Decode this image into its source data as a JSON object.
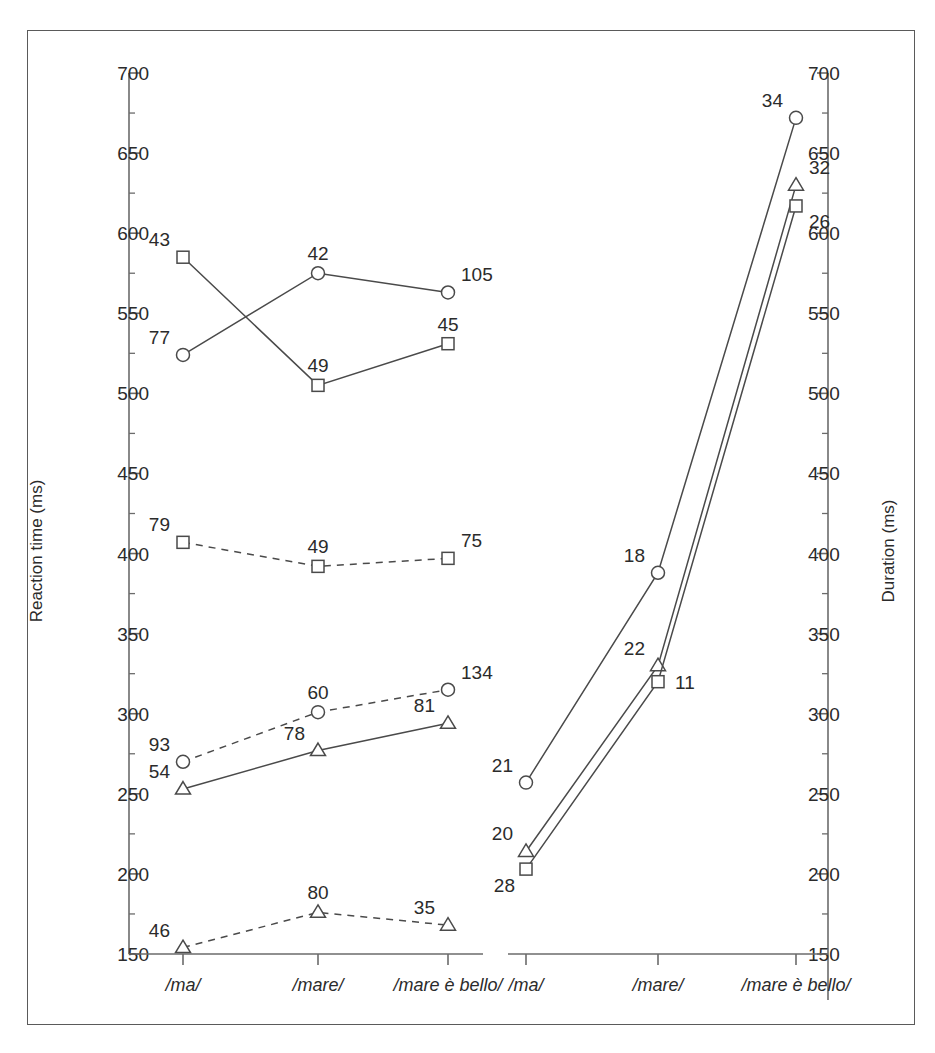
{
  "figure": {
    "background_color": "#ffffff",
    "border_color": "#5a5a5a",
    "line_color": "#4a4a4a",
    "axis_color": "#6b6b6b",
    "text_color": "#2b2b2b"
  },
  "chart_data": [
    {
      "type": "line",
      "panel": "left",
      "title": "",
      "xlabel": "",
      "ylabel": "Reaction time (ms)",
      "categories": [
        "/ma/",
        "/mare/",
        "/mare è bello/"
      ],
      "ylim": [
        150,
        700
      ],
      "ytick_step": 50,
      "yticks": [
        150,
        200,
        250,
        300,
        350,
        400,
        450,
        500,
        550,
        600,
        650,
        700
      ],
      "minor_ticks": true,
      "grid": false,
      "legend": "none",
      "series": [
        {
          "name": "solid-square",
          "marker": "square",
          "linestyle": "solid",
          "values": [
            585,
            505,
            531
          ],
          "point_labels": [
            "43",
            "49",
            "45"
          ],
          "label_positions": [
            "above-left",
            "above",
            "above"
          ]
        },
        {
          "name": "solid-circle",
          "marker": "circle",
          "linestyle": "solid",
          "values": [
            524,
            575,
            563
          ],
          "point_labels": [
            "77",
            "42",
            "105"
          ],
          "label_positions": [
            "above-left",
            "above",
            "above-right"
          ]
        },
        {
          "name": "dashed-square",
          "marker": "square",
          "linestyle": "dashed",
          "values": [
            407,
            392,
            397
          ],
          "point_labels": [
            "79",
            "49",
            "75"
          ],
          "label_positions": [
            "above-left",
            "above",
            "above-right"
          ]
        },
        {
          "name": "dashed-circle",
          "marker": "circle",
          "linestyle": "dashed",
          "values": [
            270,
            301,
            315
          ],
          "point_labels": [
            "93",
            "60",
            "134"
          ],
          "label_positions": [
            "above-left",
            "above",
            "above-right"
          ]
        },
        {
          "name": "solid-triangle",
          "marker": "triangle",
          "linestyle": "solid",
          "values": [
            253,
            277,
            294
          ],
          "point_labels": [
            "54",
            "78",
            "81"
          ],
          "label_positions": [
            "above-left",
            "above-left",
            "above-left"
          ]
        },
        {
          "name": "dashed-triangle",
          "marker": "triangle",
          "linestyle": "dashed",
          "values": [
            154,
            176,
            168
          ],
          "point_labels": [
            "46",
            "80",
            "35"
          ],
          "label_positions": [
            "above-left",
            "above",
            "above-left"
          ]
        }
      ]
    },
    {
      "type": "line",
      "panel": "right",
      "title": "",
      "xlabel": "",
      "ylabel": "Duration (ms)",
      "categories": [
        "/ma/",
        "/mare/",
        "/mare è bello/"
      ],
      "ylim": [
        150,
        700
      ],
      "ytick_step": 50,
      "yticks": [
        150,
        200,
        250,
        300,
        350,
        400,
        450,
        500,
        550,
        600,
        650,
        700
      ],
      "minor_ticks": true,
      "grid": false,
      "legend": "none",
      "series": [
        {
          "name": "solid-circle",
          "marker": "circle",
          "linestyle": "solid",
          "values": [
            257,
            388,
            672
          ],
          "point_labels": [
            "21",
            "18",
            "34"
          ],
          "label_positions": [
            "above-left",
            "above-left",
            "above-left"
          ]
        },
        {
          "name": "solid-triangle",
          "marker": "triangle",
          "linestyle": "solid",
          "values": [
            214,
            330,
            630
          ],
          "point_labels": [
            "20",
            "22",
            "32"
          ],
          "label_positions": [
            "above-left",
            "above-left",
            "above-right"
          ]
        },
        {
          "name": "solid-square",
          "marker": "square",
          "linestyle": "solid",
          "values": [
            203,
            320,
            617
          ],
          "point_labels": [
            "28",
            "11",
            "26"
          ],
          "label_positions": [
            "below-left",
            "right",
            "below-right"
          ]
        }
      ]
    }
  ],
  "left_axis": {
    "title": "Reaction time (ms)",
    "tick_labels": [
      "700",
      "650",
      "600",
      "550",
      "500",
      "450",
      "400",
      "350",
      "300",
      "250",
      "200",
      "150"
    ],
    "category_labels": [
      "/ma/",
      "/mare/",
      "/mare è bello/"
    ]
  },
  "right_axis": {
    "title": "Duration (ms)",
    "tick_labels": [
      "700",
      "650",
      "600",
      "550",
      "500",
      "450",
      "400",
      "350",
      "300",
      "250",
      "200",
      "150"
    ],
    "category_labels": [
      "/ma/",
      "/mare/",
      "/mare è bello/"
    ]
  },
  "left_point_labels": {
    "solid_square": [
      "43",
      "49",
      "45"
    ],
    "solid_circle": [
      "77",
      "42",
      "105"
    ],
    "dashed_square": [
      "79",
      "49",
      "75"
    ],
    "dashed_circle": [
      "93",
      "60",
      "134"
    ],
    "solid_triangle": [
      "54",
      "78",
      "81"
    ],
    "dashed_triangle": [
      "46",
      "80",
      "35"
    ]
  },
  "right_point_labels": {
    "solid_circle": [
      "21",
      "18",
      "34"
    ],
    "solid_triangle": [
      "20",
      "22",
      "32"
    ],
    "solid_square": [
      "28",
      "11",
      "26"
    ]
  }
}
